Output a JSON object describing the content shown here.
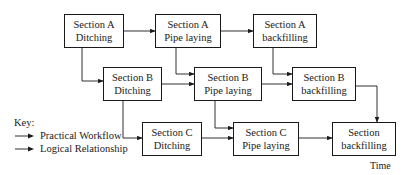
{
  "diagram": {
    "type": "workflow",
    "nodes": [
      {
        "id": "a_ditch",
        "line1": "Section A",
        "line2": "Ditching"
      },
      {
        "id": "a_pipe",
        "line1": "Section A",
        "line2": "Pipe laying"
      },
      {
        "id": "a_back",
        "line1": "Section A",
        "line2": "backfilling"
      },
      {
        "id": "b_ditch",
        "line1": "Section B",
        "line2": "Ditching"
      },
      {
        "id": "b_pipe",
        "line1": "Section B",
        "line2": "Pipe laying"
      },
      {
        "id": "b_back",
        "line1": "Section B",
        "line2": "backfilling"
      },
      {
        "id": "c_ditch",
        "line1": "Section C",
        "line2": "Ditching"
      },
      {
        "id": "c_pipe",
        "line1": "Section C",
        "line2": "Pipe laying"
      },
      {
        "id": "c_back",
        "line1": "Section",
        "line2": "backfilling"
      }
    ],
    "edges": [
      {
        "from": "a_ditch",
        "to": "a_pipe"
      },
      {
        "from": "a_pipe",
        "to": "a_back"
      },
      {
        "from": "a_ditch",
        "to": "b_ditch"
      },
      {
        "from": "a_pipe",
        "to": "b_pipe"
      },
      {
        "from": "a_back",
        "to": "b_back"
      },
      {
        "from": "b_ditch",
        "to": "b_pipe"
      },
      {
        "from": "b_pipe",
        "to": "b_back"
      },
      {
        "from": "b_ditch",
        "to": "c_ditch"
      },
      {
        "from": "b_pipe",
        "to": "c_pipe"
      },
      {
        "from": "b_back",
        "to": "c_back"
      },
      {
        "from": "c_ditch",
        "to": "c_pipe"
      },
      {
        "from": "c_pipe",
        "to": "c_back"
      }
    ]
  },
  "key": {
    "title": "Key:",
    "items": [
      {
        "label": "Practical Workflow",
        "style": "arrow"
      },
      {
        "label": "Logical Relationship",
        "style": "arrow"
      }
    ]
  },
  "axis": {
    "time_label": "Time"
  }
}
